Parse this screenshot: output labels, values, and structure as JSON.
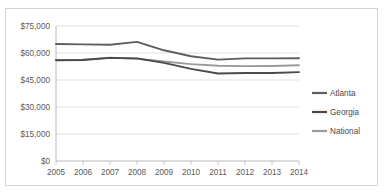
{
  "chart_data": {
    "type": "line",
    "title": "",
    "subtitle": "",
    "xlabel": "",
    "ylabel": "",
    "categories": [
      "2005",
      "2006",
      "2007",
      "2008",
      "2009",
      "2010",
      "2011",
      "2012",
      "2013",
      "2014"
    ],
    "x": [
      2005,
      2006,
      2007,
      2008,
      2009,
      2010,
      2011,
      2012,
      2013,
      2014
    ],
    "ylim": [
      0,
      75000
    ],
    "ytick_values": [
      0,
      15000,
      30000,
      45000,
      60000,
      75000
    ],
    "ytick_labels": [
      "$0",
      "$15,000",
      "$30,000",
      "$45,000",
      "$60,000",
      "$75,000"
    ],
    "grid": true,
    "legend_position": "right",
    "series": [
      {
        "name": "Atlanta",
        "color": "#5e5e5e",
        "values": [
          65000,
          64800,
          64600,
          66200,
          61500,
          58200,
          56300,
          57000,
          57000,
          57100
        ]
      },
      {
        "name": "Georgia",
        "color": "#4a4a4a",
        "values": [
          56000,
          56100,
          57300,
          57000,
          54500,
          51200,
          48600,
          48900,
          48900,
          49400
        ]
      },
      {
        "name": "National",
        "color": "#9a9a9a",
        "values": [
          56200,
          56300,
          57400,
          56800,
          55300,
          53800,
          52900,
          52700,
          52800,
          53200
        ]
      }
    ]
  },
  "legend": {
    "items": [
      {
        "label": "Atlanta"
      },
      {
        "label": "Georgia"
      },
      {
        "label": "National"
      }
    ]
  },
  "axis": {
    "y_labels": [
      "$75,000",
      "$60,000",
      "$45,000",
      "$30,000",
      "$15,000",
      "$0"
    ],
    "x_labels": [
      "2005",
      "2006",
      "2007",
      "2008",
      "2009",
      "2010",
      "2011",
      "2012",
      "2013",
      "2014"
    ]
  }
}
